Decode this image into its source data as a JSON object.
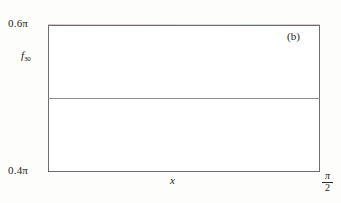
{
  "figure": {
    "panel_label": "(b)",
    "background_color": "#fdfdfc",
    "frame_color": "#6e6e6e",
    "curve_color": "#1a1a1a",
    "reference_line_color": "#8f8f8f"
  },
  "axes": {
    "y_top_label": "0.6π",
    "y_bottom_label": "0.4π",
    "y_series_label": "f",
    "y_series_subscript": "30",
    "x_label": "x",
    "x_right_numerator": "π",
    "x_right_denominator": "2"
  },
  "chart_data": {
    "type": "line",
    "title": "",
    "subtitle": "",
    "xlabel": "x",
    "ylabel": "f_30",
    "xlim": [
      0,
      1.5707963
    ],
    "ylim": [
      1.2566371,
      1.8849556
    ],
    "ylim_labels": [
      "0.4π",
      "0.6π"
    ],
    "xlim_labels": [
      "",
      "π/2"
    ],
    "grid": false,
    "legend": false,
    "annotations": [
      {
        "text": "(b)",
        "position": "top-right"
      }
    ],
    "reference_lines": [
      {
        "orientation": "horizontal",
        "value": 1.5707963,
        "label": "π/2",
        "color": "#8f8f8f"
      }
    ],
    "series": [
      {
        "name": "f_30",
        "description": "Partial Fourier sum of order 30 exhibiting Gibbs phenomenon: damped oscillation about pi/2 with ~9% overshoot near the left discontinuity.",
        "n_terms": 30,
        "mean_level": 1.5707963,
        "overshoot_peak": 1.8535,
        "n_visible_peaks": 9,
        "x": [
          0.0,
          0.0105,
          0.021,
          0.0314,
          0.0419,
          0.0524,
          0.0628,
          0.0733,
          0.0838,
          0.0942,
          0.1047,
          0.1152,
          0.1257,
          0.1361,
          0.1466,
          0.1571,
          0.1675,
          0.178,
          0.1885,
          0.199,
          0.2094,
          0.2199,
          0.2304,
          0.2409,
          0.2513,
          0.2618,
          0.2723,
          0.2827,
          0.2932,
          0.3037,
          0.3142,
          0.3246,
          0.3351,
          0.3456,
          0.356,
          0.3665,
          0.377,
          0.3875,
          0.3979,
          0.4084,
          0.4189,
          0.4294,
          0.4398,
          0.4503,
          0.4608,
          0.4712,
          0.4817,
          0.4922,
          0.5027,
          0.5131,
          0.5236,
          0.5341,
          0.5445,
          0.555,
          0.5655,
          0.576,
          0.5864,
          0.5969,
          0.6074,
          0.6178,
          0.6283,
          0.6388,
          0.6492,
          0.6597,
          0.6702,
          0.6807,
          0.6911,
          0.7016,
          0.7121,
          0.7226,
          0.733,
          0.7435,
          0.754,
          0.7644,
          0.7749,
          0.7854,
          0.7959,
          0.8063,
          0.8168,
          0.8273,
          0.8378,
          0.8482,
          0.8587,
          0.8692,
          0.8796,
          0.8901,
          0.9006,
          0.9111,
          0.9215,
          0.932,
          0.9425,
          0.9529,
          0.9634,
          0.9739,
          0.9844,
          0.9948,
          1.0053,
          1.0158,
          1.0263,
          1.0367,
          1.0472,
          1.0577,
          1.0681,
          1.0786,
          1.0891,
          1.0996,
          1.11,
          1.1205,
          1.131,
          1.1414,
          1.1519,
          1.1624,
          1.1729,
          1.1833,
          1.1938,
          1.2043,
          1.2147,
          1.2252,
          1.2357,
          1.2462,
          1.2566,
          1.2671,
          1.2776,
          1.2881,
          1.2985,
          1.309,
          1.3195,
          1.3299,
          1.3404,
          1.3509,
          1.3614,
          1.3718,
          1.3823,
          1.3928,
          1.4033,
          1.4137,
          1.4242,
          1.4347,
          1.4451,
          1.4556,
          1.4661,
          1.4766,
          1.487,
          1.4975,
          1.508,
          1.5184,
          1.5289,
          1.5394,
          1.5499,
          1.5603,
          1.5708
        ],
        "y_description": "Values oscillate about pi/2 (1.5708) with envelope decaying roughly as 1/x; first maximum ~1.8535 at x~0.052, first minimum ~1.3960 at x~0.155, subsequent extrema approach pi/2."
      }
    ]
  }
}
